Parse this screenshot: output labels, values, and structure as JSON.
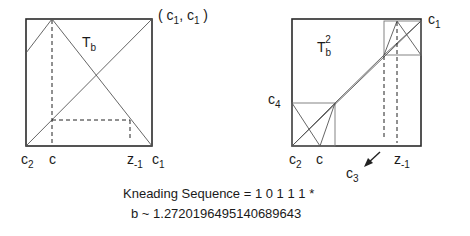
{
  "left_panel": {
    "title_main": "T",
    "title_sub": "b",
    "corner_label": "( c",
    "corner_label_sub1": "1",
    "corner_label_mid": ", c",
    "corner_label_sub2": "1",
    "corner_label_end": " )",
    "axis_labels": {
      "c2_main": "c",
      "c2_sub": "2",
      "c": "c",
      "z_main": "z",
      "z_sub": "-1",
      "c1_main": "c",
      "c1_sub": "1"
    }
  },
  "right_panel": {
    "title_main": "T",
    "title_sub": "b",
    "title_sup": "2",
    "corner_label_main": "c",
    "corner_label_sub": "1",
    "left_label_main": "c",
    "left_label_sub": "4",
    "axis_labels": {
      "c2_main": "c",
      "c2_sub": "2",
      "c": "c",
      "c3_main": "c",
      "c3_sub": "3",
      "z_main": "z",
      "z_sub": "-1"
    }
  },
  "caption": {
    "kneading": "Kneading Sequence = 1 0 1 1 1 *",
    "b_value": "b ~ 1.2720196495140689643"
  },
  "colors": {
    "box": "#2a2a2a",
    "thin": "#555555",
    "text": "#1a1a1a"
  }
}
